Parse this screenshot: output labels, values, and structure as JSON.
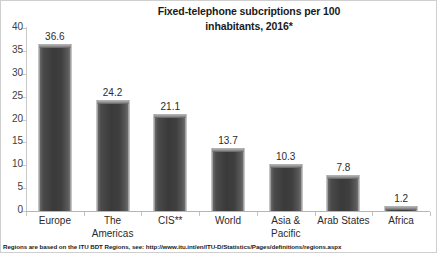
{
  "chart_data": {
    "type": "bar",
    "title": "Fixed-telephone subcriptions per 100 inhabitants, 2016*",
    "title_line1": "Fixed-telephone subcriptions per 100",
    "title_line2": "inhabitants, 2016*",
    "categories": [
      "Europe",
      "The Americas",
      "CIS**",
      "World",
      "Asia & Pacific",
      "Arab States",
      "Africa"
    ],
    "category_lines": [
      [
        "Europe",
        ""
      ],
      [
        "The",
        "Americas"
      ],
      [
        "CIS**",
        ""
      ],
      [
        "World",
        ""
      ],
      [
        "Asia &",
        "Pacific"
      ],
      [
        "Arab States",
        ""
      ],
      [
        "Africa",
        ""
      ]
    ],
    "values": [
      36.6,
      24.2,
      21.1,
      13.7,
      10.3,
      7.8,
      1.2
    ],
    "value_labels": [
      "36.6",
      "24.2",
      "21.1",
      "13.7",
      "10.3",
      "7.8",
      "1.2"
    ],
    "xlabel": "",
    "ylabel": "",
    "ylim": [
      0,
      40
    ],
    "ytick_labels": [
      "0",
      "5",
      "10",
      "15",
      "20",
      "25",
      "30",
      "35",
      "40"
    ],
    "ytick_values": [
      0,
      5,
      10,
      15,
      20,
      25,
      30,
      35,
      40
    ],
    "grid": false,
    "legend": false,
    "series_color": "#3f3f3f",
    "axis_color": "#c4c4c4",
    "text_color": "#2b2b2b"
  },
  "footnote": {
    "text": "Regions are based on the ITU BDT Regions, see: http://www.itu.int/en/ITU-D/Statistics/Pages/definitions/regions.aspx"
  }
}
